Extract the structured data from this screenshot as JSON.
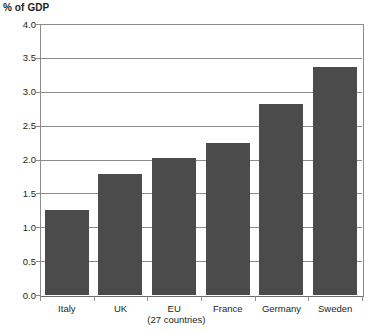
{
  "chart_data": {
    "type": "bar",
    "title": "% of GDP",
    "xlabel": "",
    "ylabel": "% of GDP",
    "categories": [
      "Italy",
      "UK",
      "EU",
      "France",
      "Germany",
      "Sweden"
    ],
    "category_sublabels": [
      "",
      "",
      "(27 countries)",
      "",
      "",
      ""
    ],
    "values": [
      1.25,
      1.78,
      2.02,
      2.24,
      2.82,
      3.36
    ],
    "ylim": [
      0.0,
      4.0
    ],
    "ytick_labels": [
      "0.0",
      "0.5",
      "1.0",
      "1.5",
      "2.0",
      "2.5",
      "3.0",
      "3.5",
      "4.0"
    ],
    "ytick_values": [
      0.0,
      0.5,
      1.0,
      1.5,
      2.0,
      2.5,
      3.0,
      3.5,
      4.0
    ],
    "grid": true,
    "legend": null,
    "bar_color": "#4b4b4b",
    "axis_color": "#8c8c8c",
    "background_color": "#ffffff"
  }
}
